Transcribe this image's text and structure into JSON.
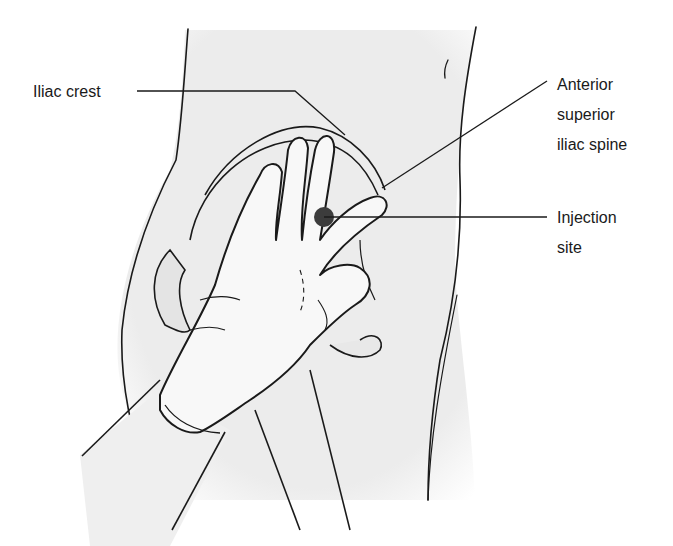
{
  "figure": {
    "labels": {
      "iliac_crest": "Iliac crest",
      "asis": "Anterior\nsuperior\niliac spine",
      "injection_site": "Injection\nsite"
    },
    "colors": {
      "skin_fill": "#ededed",
      "glove_fill": "#f8f8f8",
      "outline": "#1a1a1a",
      "injection_dot": "#3c3c3c",
      "background": "#ffffff"
    }
  }
}
